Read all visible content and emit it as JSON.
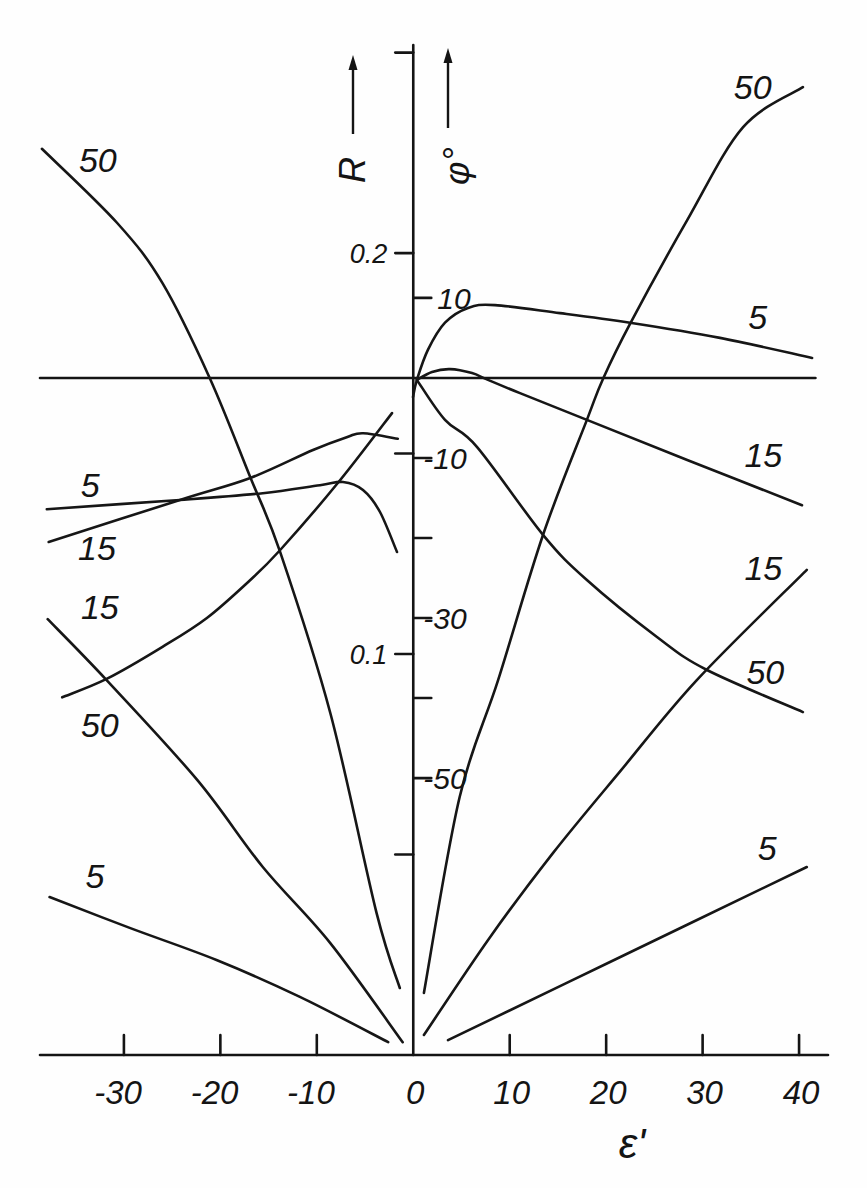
{
  "chart_data": {
    "type": "line",
    "title": "",
    "xlabel": "ε'",
    "xlim": [
      -38.7,
      43.0
    ],
    "grid": false,
    "legend": "none (curves labelled inline with parameter values)",
    "x_axis": {
      "ticks": [
        {
          "value": -30,
          "label": "-30"
        },
        {
          "value": -20,
          "label": "-20"
        },
        {
          "value": -10,
          "label": "-10"
        },
        {
          "value": 0,
          "label": "0"
        },
        {
          "value": 10,
          "label": "10"
        },
        {
          "value": 20,
          "label": "20"
        },
        {
          "value": 30,
          "label": "30"
        },
        {
          "value": 40,
          "label": "40"
        }
      ]
    },
    "y_axes": {
      "R": {
        "label": "R",
        "position": "left of central axis",
        "ylim": [
          0,
          0.2519
        ],
        "ticks": [
          {
            "value": 0.25,
            "label": ""
          },
          {
            "value": 0.2,
            "label": "0.2"
          },
          {
            "value": 0.15,
            "label": ""
          },
          {
            "value": 0.1,
            "label": "0.1"
          },
          {
            "value": 0.05,
            "label": ""
          }
        ]
      },
      "phi": {
        "label": "φ°",
        "position": "right of central axis",
        "ylim": [
          -84.6,
          41.6
        ],
        "zero_line_xrange": [
          -38.7,
          41.7
        ],
        "ticks": [
          {
            "value": 10,
            "label": "10"
          },
          {
            "value": -10,
            "label": "-10"
          },
          {
            "value": -20,
            "label": ""
          },
          {
            "value": -30,
            "label": "-30"
          },
          {
            "value": -40,
            "label": ""
          },
          {
            "value": -50,
            "label": "-50"
          }
        ]
      }
    },
    "series": [
      {
        "name": "R, 5 (ε'<0)",
        "quantity": "R",
        "parameter": "5",
        "branch": "left",
        "label": "5",
        "label_at": [
          -33.0,
          0.0446
        ],
        "points": [
          [
            -37.7,
            0.0394
          ],
          [
            -29.4,
            0.0317
          ],
          [
            -20.4,
            0.0237
          ],
          [
            -11.75,
            0.0145
          ],
          [
            -2.6,
            0.0032
          ]
        ]
      },
      {
        "name": "R, 15 (ε'<0)",
        "quantity": "R",
        "parameter": "15",
        "branch": "left",
        "label": "15",
        "label_at": [
          -32.5,
          0.1117
        ],
        "points": [
          [
            -37.9,
            0.1087
          ],
          [
            -31.8,
            0.0935
          ],
          [
            -22.4,
            0.0686
          ],
          [
            -15.6,
            0.0469
          ],
          [
            -8.6,
            0.0279
          ],
          [
            -1.1,
            0.0032
          ]
        ]
      },
      {
        "name": "R, 50 (ε'<0)",
        "quantity": "R",
        "parameter": "50",
        "branch": "left",
        "label": "50",
        "label_at": [
          -32.7,
          0.2232
        ],
        "points": [
          [
            -38.5,
            0.226
          ],
          [
            -30.7,
            0.2075
          ],
          [
            -26.0,
            0.1925
          ],
          [
            -21.1,
            0.1688
          ],
          [
            -16.9,
            0.1441
          ],
          [
            -13.8,
            0.1254
          ],
          [
            -8.6,
            0.0853
          ],
          [
            -3.8,
            0.0354
          ],
          [
            -1.4,
            0.0167
          ]
        ]
      },
      {
        "name": "R, 5 (ε'>0)",
        "quantity": "R",
        "parameter": "5",
        "branch": "right",
        "label": "5",
        "label_at": [
          36.7,
          0.0516
        ],
        "points": [
          [
            3.6,
            0.0037
          ],
          [
            20.4,
            0.0232
          ],
          [
            40.8,
            0.0469
          ]
        ]
      },
      {
        "name": "R, 15 (ε'>0)",
        "quantity": "R",
        "parameter": "15",
        "branch": "right",
        "label": "15",
        "label_at": [
          36.3,
          0.1214
        ],
        "points": [
          [
            1.1,
            0.005
          ],
          [
            7.9,
            0.0292
          ],
          [
            14.5,
            0.0504
          ],
          [
            21.4,
            0.0706
          ],
          [
            29.4,
            0.0935
          ],
          [
            40.8,
            0.121
          ]
        ]
      },
      {
        "name": "R, 50 (ε'>0)",
        "quantity": "R",
        "parameter": "50",
        "branch": "right",
        "label": "50",
        "label_at": [
          35.2,
          0.2414
        ],
        "points": [
          [
            1.1,
            0.0155
          ],
          [
            4.8,
            0.0643
          ],
          [
            8.8,
            0.0935
          ],
          [
            13.45,
            0.1297
          ],
          [
            18.0,
            0.1584
          ],
          [
            19.7,
            0.1688
          ],
          [
            22.5,
            0.1825
          ],
          [
            28.4,
            0.2082
          ],
          [
            34.2,
            0.2314
          ],
          [
            40.4,
            0.2414
          ]
        ]
      },
      {
        "name": "φ, 5 (ε'<0)",
        "quantity": "phi",
        "parameter": "5",
        "branch": "left",
        "label": "5",
        "label_at": [
          -33.5,
          -13.4
        ],
        "points": [
          [
            -37.99,
            -16.4
          ],
          [
            -24.2,
            -15.25
          ],
          [
            -15.6,
            -14.4
          ],
          [
            -9.67,
            -13.4
          ],
          [
            -7.28,
            -13.0
          ],
          [
            -5.21,
            -14.0
          ],
          [
            -3.45,
            -16.75
          ],
          [
            -1.69,
            -21.75
          ]
        ]
      },
      {
        "name": "φ, 15 (ε'<0)",
        "quantity": "phi",
        "parameter": "15",
        "branch": "left",
        "label": "15",
        "label_at": [
          -32.8,
          -21.25
        ],
        "points": [
          [
            -37.8,
            -20.5
          ],
          [
            -24.2,
            -15.25
          ],
          [
            -16.9,
            -12.5
          ],
          [
            -10.4,
            -9.0
          ],
          [
            -6.9,
            -7.4
          ],
          [
            -5.2,
            -6.9
          ],
          [
            -1.6,
            -7.6
          ]
        ]
      },
      {
        "name": "φ, 50 (ε'<0)",
        "quantity": "phi",
        "parameter": "50",
        "branch": "left",
        "label": "50",
        "label_at": [
          -32.5,
          -43.4
        ],
        "points": [
          [
            -36.4,
            -39.9
          ],
          [
            -31.8,
            -37.6
          ],
          [
            -26.0,
            -33.6
          ],
          [
            -21.4,
            -30.0
          ],
          [
            -16.9,
            -25.25
          ],
          [
            -13.8,
            -21.5
          ],
          [
            -7.8,
            -13.1
          ],
          [
            -2.2,
            -4.4
          ]
        ]
      },
      {
        "name": "φ, 5 (ε'>0)",
        "quantity": "phi",
        "parameter": "5",
        "branch": "right",
        "label": "5",
        "label_at": [
          35.7,
          7.6
        ],
        "points": [
          [
            -0.03,
            -2.4
          ],
          [
            0.38,
            -0.25
          ],
          [
            1.52,
            3.5
          ],
          [
            3.29,
            6.9
          ],
          [
            5.67,
            8.75
          ],
          [
            8.47,
            9.1
          ],
          [
            15.21,
            8.1
          ],
          [
            22.47,
            6.9
          ],
          [
            31.8,
            5.0
          ],
          [
            41.35,
            2.5
          ]
        ]
      },
      {
        "name": "φ, 15 (ε'>0)",
        "quantity": "phi",
        "parameter": "15",
        "branch": "right",
        "label": "15",
        "label_at": [
          36.3,
          -9.6
        ],
        "points": [
          [
            0.38,
            -0.25
          ],
          [
            1.94,
            0.75
          ],
          [
            3.81,
            1.1
          ],
          [
            6.09,
            0.6
          ],
          [
            7.75,
            -0.25
          ],
          [
            11.07,
            -1.9
          ],
          [
            18.0,
            -5.25
          ],
          [
            28.4,
            -10.25
          ],
          [
            40.3,
            -15.9
          ]
        ]
      },
      {
        "name": "φ, 50 (ε'>0)",
        "quantity": "phi",
        "parameter": "50",
        "branch": "right",
        "label": "50",
        "label_at": [
          36.5,
          -36.75
        ],
        "points": [
          [
            0.38,
            -0.25
          ],
          [
            3.29,
            -5.25
          ],
          [
            6.6,
            -8.6
          ],
          [
            13.45,
            -19.6
          ],
          [
            18.0,
            -25.25
          ],
          [
            25.3,
            -32.4
          ],
          [
            30.45,
            -36.5
          ],
          [
            40.4,
            -41.75
          ]
        ]
      }
    ]
  }
}
